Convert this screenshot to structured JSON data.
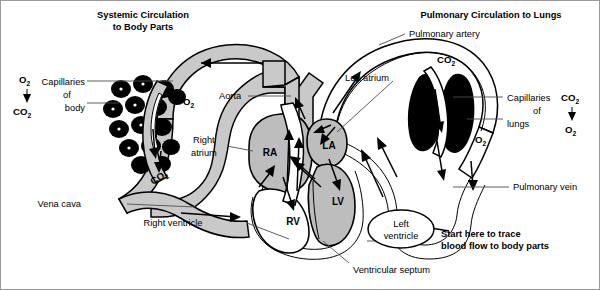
{
  "diagram": {
    "title_left": "Systemic Circulation",
    "title_left2": "to Body Parts",
    "title_right": "Pulmonary Circulation to Lungs"
  },
  "labels": {
    "pulmonary_artery": "Pulmonary artery",
    "pulmonary_vein": "Pulmonary vein",
    "aorta": "Aorta",
    "vena_cava": "Vena cava",
    "right_atrium_1": "Right",
    "right_atrium_2": "atrium",
    "left_atrium": "Left atrium",
    "right_ventricle": "Right ventricle",
    "left_ventricle_1": "Left",
    "left_ventricle_2": "ventricle",
    "ventricular_septum": "Ventricular septum",
    "capillaries_body_1": "Capillaries",
    "capillaries_body_2": "of",
    "capillaries_body_3": "body",
    "capillaries_lungs_1": "Capillaries",
    "capillaries_lungs_2": "of",
    "capillaries_lungs_3": "lungs",
    "start_here_1": "Start here to trace",
    "start_here_2": "blood flow to body parts"
  },
  "chambers": {
    "ra": "RA",
    "la": "LA",
    "lv": "LV",
    "rv": "RV"
  },
  "gases": {
    "o2": "O",
    "co2": "CO",
    "sub2": "2",
    "body_top": "O2",
    "body_bottom": "CO2",
    "lungs_top": "CO2",
    "lungs_bottom": "O2",
    "vessel_o2": "O2",
    "vessel_co2": "CO2",
    "lung_co2": "CO2",
    "lung_o2": "O2"
  },
  "colors": {
    "vessel_gray": "#c9c9c9",
    "chamber_gray": "#bdbdbd",
    "stroke": "#000000",
    "leader": "#4d4d4d",
    "background": "#ffffff"
  }
}
